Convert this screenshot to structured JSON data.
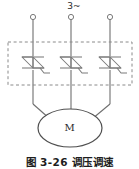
{
  "figure": {
    "caption": "图 3-26  调压调速",
    "supply_label": "3~",
    "motor_label": "M"
  },
  "colors": {
    "wire": "#6f6f6f",
    "symbol": "#7a7a7a",
    "dashed_box": "#8a8a8a",
    "text": "#2b2b2b",
    "caption": "#1d1d1d",
    "background": "#ffffff"
  },
  "circuit": {
    "type": "three-phase ac voltage regulator motor drive",
    "terminals": [
      {
        "name": "phase-l1-terminal",
        "x": 33,
        "y": 17
      },
      {
        "name": "phase-l2-terminal",
        "x": 71,
        "y": 17
      },
      {
        "name": "phase-l3-terminal",
        "x": 110,
        "y": 17
      }
    ],
    "dashed_enclosure": {
      "x": 8,
      "y": 42,
      "width": 124,
      "height": 43
    },
    "thyristor_modules": [
      {
        "name": "triac-phase-l1",
        "cx": 33,
        "cy": 63
      },
      {
        "name": "triac-phase-l2",
        "cx": 71,
        "cy": 63
      },
      {
        "name": "triac-phase-l3",
        "cx": 110,
        "cy": 63
      }
    ],
    "motor": {
      "name": "motor-m",
      "cx": 70,
      "cy": 128,
      "rx": 32,
      "ry": 19
    }
  }
}
